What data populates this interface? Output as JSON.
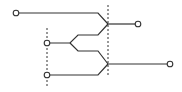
{
  "diagram": {
    "type": "tree-merge",
    "colors": {
      "line": "#333333",
      "node_fill": "#ffffff",
      "dash": "#333333"
    },
    "nodes": [
      {
        "id": "in-top",
        "x": 16,
        "y": 13
      },
      {
        "id": "in-mid",
        "x": 47,
        "y": 43
      },
      {
        "id": "in-bottom",
        "x": 47,
        "y": 75
      },
      {
        "id": "out-top",
        "x": 138,
        "y": 24
      },
      {
        "id": "out-bottom",
        "x": 170,
        "y": 64
      }
    ],
    "paths": [
      {
        "id": "path-top",
        "d": "M19 13 L98 13 L108 24"
      },
      {
        "id": "path-fork-up",
        "d": "M50 43 L70 43 L78 35 L98 35 L108 24"
      },
      {
        "id": "path-fork-down",
        "d": "M70 43 L78 51 L98 51 L108 64"
      },
      {
        "id": "path-bottom",
        "d": "M50 75 L98 75 L108 64"
      },
      {
        "id": "path-out-top",
        "d": "M108 24 L135 24"
      },
      {
        "id": "path-out-bottom",
        "d": "M108 64 L167 64"
      }
    ],
    "dashed_lines": [
      {
        "id": "dash-right",
        "x1": 108,
        "y1": 5,
        "x2": 108,
        "y2": 76
      },
      {
        "id": "dash-left",
        "x1": 47,
        "y1": 28,
        "x2": 47,
        "y2": 86
      }
    ]
  }
}
